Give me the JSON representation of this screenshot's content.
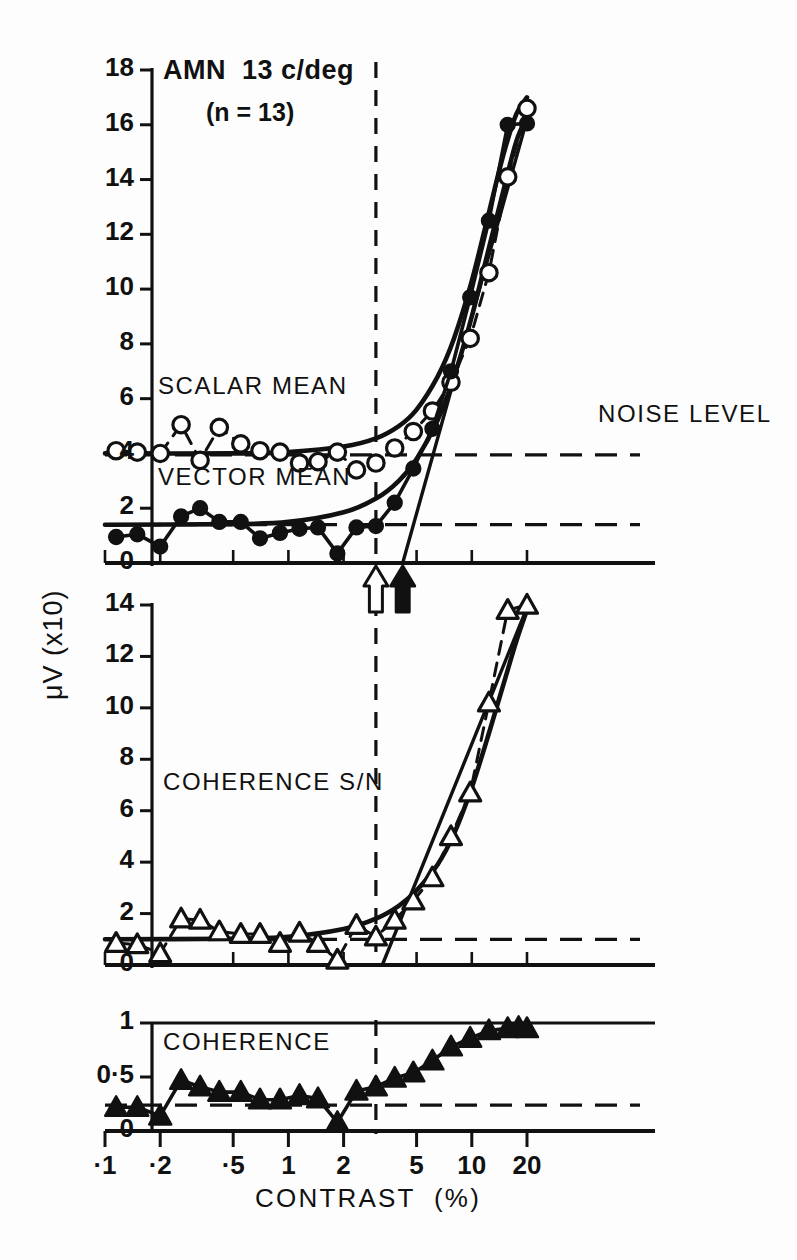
{
  "figure": {
    "title": "AMN  13 c/deg",
    "subtitle": "(n = 13)",
    "y_axis_label": "μV (x10)",
    "x_axis_label": "CONTRAST  (%)",
    "annotations": {
      "scalar_mean": "SCALAR MEAN",
      "vector_mean": "VECTOR MEAN",
      "noise_level": "NOISE LEVEL",
      "coherence_sn": "COHERENCE S/N",
      "coherence": "COHERENCE"
    },
    "markers": {
      "open_arrow_contrast": 3.0,
      "filled_arrow_contrast": 4.2,
      "dashed_vertical_contrast": 3.0
    }
  },
  "chart_data": [
    {
      "type": "line",
      "panel": "top",
      "title": "AMN  13 c/deg",
      "xlabel": "CONTRAST  (%)",
      "ylabel": "μV (x10)",
      "xscale": "log",
      "xlim": [
        0.1,
        25
      ],
      "ylim": [
        0,
        18
      ],
      "yticks": [
        0,
        2,
        4,
        6,
        8,
        10,
        12,
        14,
        16,
        18
      ],
      "xticks": [
        0.1,
        0.2,
        0.5,
        1,
        2,
        5,
        10,
        20
      ],
      "xticklabels": [
        "·1",
        "·2",
        "·5",
        "1",
        "2",
        "5",
        "10",
        "20"
      ],
      "grid": false,
      "noise_level_scalar": 3.95,
      "noise_level_vector": 1.4,
      "series": [
        {
          "name": "SCALAR MEAN",
          "marker": "open-circle",
          "linestyle": "dashed",
          "x": [
            0.115,
            0.15,
            0.2,
            0.26,
            0.33,
            0.42,
            0.55,
            0.7,
            0.9,
            1.15,
            1.45,
            1.85,
            2.35,
            3.0,
            3.8,
            4.8,
            6.1,
            7.7,
            9.8,
            12.4,
            15.7,
            20.0
          ],
          "y": [
            4.1,
            4.05,
            4.0,
            5.05,
            3.75,
            4.95,
            4.35,
            4.1,
            4.05,
            3.65,
            3.7,
            4.05,
            3.4,
            3.65,
            4.2,
            4.8,
            5.55,
            6.6,
            8.2,
            10.6,
            14.1,
            16.6
          ]
        },
        {
          "name": "VECTOR MEAN",
          "marker": "filled-circle",
          "linestyle": "solid",
          "x": [
            0.115,
            0.15,
            0.2,
            0.26,
            0.33,
            0.42,
            0.55,
            0.7,
            0.9,
            1.15,
            1.45,
            1.85,
            2.35,
            3.0,
            3.8,
            4.8,
            6.1,
            7.7,
            9.8,
            12.4,
            15.7,
            20.0
          ],
          "y": [
            0.95,
            1.05,
            0.6,
            1.7,
            2.0,
            1.5,
            1.5,
            0.9,
            1.1,
            1.25,
            1.3,
            0.35,
            1.3,
            1.35,
            2.2,
            3.45,
            4.9,
            7.0,
            9.7,
            12.5,
            16.0,
            16.05
          ]
        },
        {
          "name": "SCALAR MEAN fitted",
          "marker": "none",
          "linestyle": "solid-fit",
          "x": [
            0.1,
            0.5,
            1.0,
            2.0,
            3.0,
            4.0,
            5.0,
            6.5,
            8.0,
            10.0,
            12.5,
            15.0,
            17.5,
            20.0
          ],
          "y": [
            4.0,
            4.0,
            4.05,
            4.25,
            4.55,
            5.0,
            5.6,
            6.8,
            8.2,
            10.3,
            12.9,
            15.0,
            16.4,
            17.0
          ]
        },
        {
          "name": "VECTOR MEAN fitted",
          "marker": "none",
          "linestyle": "solid-fit",
          "x": [
            0.1,
            0.5,
            1.0,
            2.0,
            3.0,
            4.0,
            5.0,
            6.5,
            8.0,
            10.0,
            12.5,
            15.0,
            17.5,
            20.0
          ],
          "y": [
            1.4,
            1.42,
            1.5,
            1.85,
            2.35,
            3.0,
            3.8,
            5.2,
            6.8,
            9.0,
            11.6,
            13.7,
            15.4,
            16.3
          ]
        },
        {
          "name": "threshold line",
          "marker": "none",
          "linestyle": "straight",
          "x": [
            4.2,
            20.0
          ],
          "y": [
            0.0,
            16.2
          ]
        }
      ]
    },
    {
      "type": "line",
      "panel": "middle",
      "xlabel": "CONTRAST  (%)",
      "ylabel": "μV (x10)",
      "xscale": "log",
      "xlim": [
        0.1,
        25
      ],
      "ylim": [
        0,
        14
      ],
      "yticks": [
        0,
        2,
        4,
        6,
        8,
        10,
        12,
        14
      ],
      "grid": false,
      "noise_level": 1.0,
      "series": [
        {
          "name": "COHERENCE S/N",
          "marker": "open-triangle",
          "linestyle": "dashed",
          "x": [
            0.115,
            0.15,
            0.2,
            0.26,
            0.33,
            0.42,
            0.55,
            0.7,
            0.9,
            1.15,
            1.45,
            1.85,
            2.35,
            3.0,
            3.8,
            4.8,
            6.1,
            7.7,
            9.8,
            12.4,
            15.7,
            20.0
          ],
          "y": [
            0.85,
            0.8,
            0.45,
            1.8,
            1.75,
            1.3,
            1.2,
            1.2,
            0.85,
            1.25,
            0.85,
            0.2,
            1.55,
            1.1,
            1.75,
            2.5,
            3.4,
            5.0,
            6.7,
            10.2,
            13.8,
            14.0
          ]
        },
        {
          "name": "COHERENCE S/N fitted",
          "marker": "none",
          "linestyle": "solid-fit",
          "x": [
            0.1,
            0.5,
            1.0,
            2.0,
            3.0,
            4.0,
            5.0,
            6.5,
            8.0,
            10.0,
            12.5,
            15.0,
            17.5,
            20.0
          ],
          "y": [
            1.0,
            1.02,
            1.1,
            1.4,
            1.8,
            2.3,
            2.9,
            3.9,
            5.1,
            6.9,
            9.1,
            11.0,
            12.6,
            13.8
          ]
        },
        {
          "name": "threshold line",
          "marker": "none",
          "linestyle": "straight",
          "x": [
            3.25,
            20.0
          ],
          "y": [
            0.0,
            13.9
          ]
        }
      ]
    },
    {
      "type": "line",
      "panel": "bottom",
      "xlabel": "CONTRAST  (%)",
      "ylabel": "COHERENCE",
      "xscale": "log",
      "xlim": [
        0.1,
        25
      ],
      "ylim": [
        0,
        1
      ],
      "yticks": [
        0,
        0.5,
        1
      ],
      "yticklabels": [
        "0",
        "0·5",
        "1"
      ],
      "grid": false,
      "noise_level": 0.24,
      "series": [
        {
          "name": "COHERENCE",
          "marker": "filled-triangle",
          "linestyle": "solid",
          "x": [
            0.115,
            0.15,
            0.2,
            0.26,
            0.33,
            0.42,
            0.55,
            0.7,
            0.9,
            1.15,
            1.45,
            1.85,
            2.35,
            3.0,
            3.8,
            4.8,
            6.1,
            7.7,
            9.8,
            12.4,
            15.7,
            18.0,
            20.0
          ],
          "y": [
            0.22,
            0.22,
            0.14,
            0.47,
            0.41,
            0.36,
            0.36,
            0.29,
            0.29,
            0.33,
            0.3,
            0.08,
            0.37,
            0.41,
            0.49,
            0.54,
            0.65,
            0.78,
            0.86,
            0.93,
            0.95,
            0.96,
            0.95
          ]
        }
      ]
    }
  ]
}
